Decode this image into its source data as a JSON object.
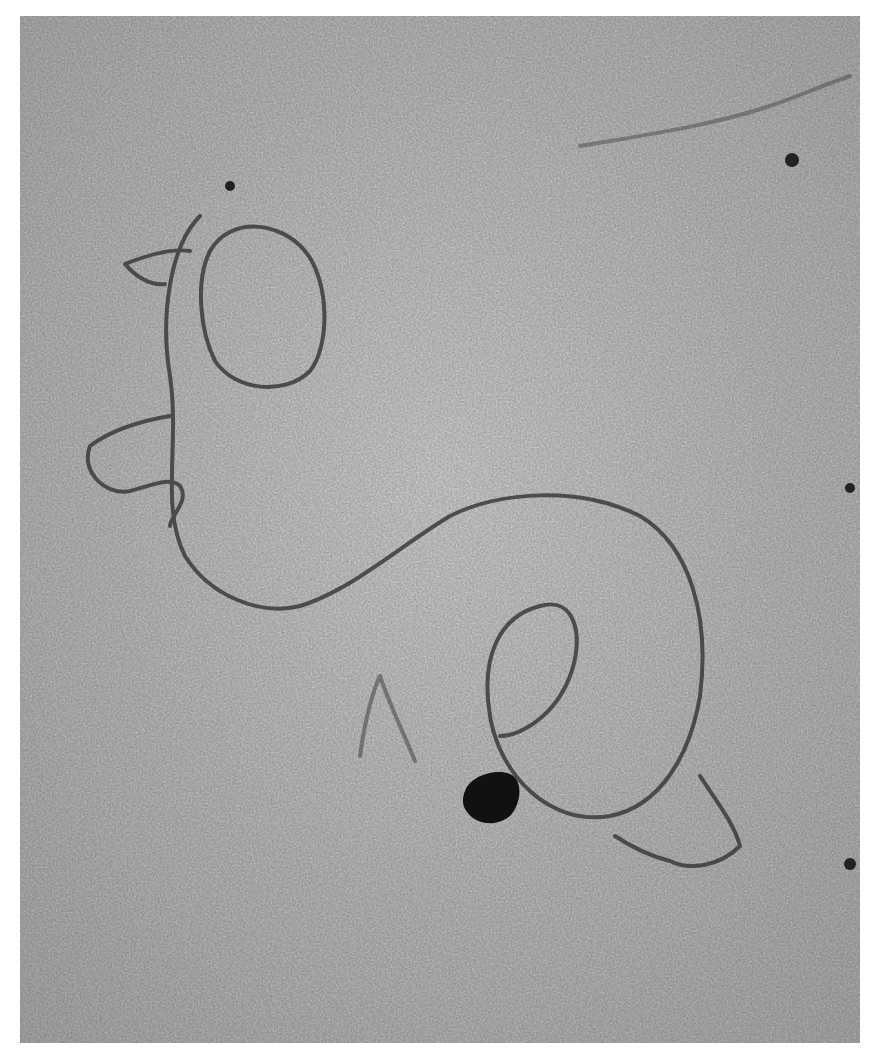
{
  "image": {
    "type": "electron-micrograph",
    "subject": "DNA molecule with loops",
    "tone": "grayscale",
    "colors": {
      "background": "#ffffff",
      "field": "#9a9a9a",
      "strand": "#3a3a3a",
      "particle": "#111111"
    }
  }
}
